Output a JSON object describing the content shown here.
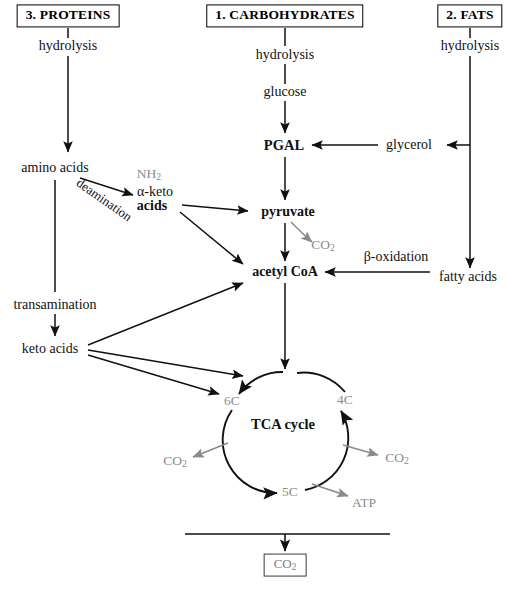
{
  "figure": {
    "caption": "",
    "colors": {
      "stroke_black": "#111111",
      "stroke_grey": "#8a8a8a",
      "text_black": "#111111",
      "text_grey": "#8a8a8a",
      "background": "#ffffff"
    }
  },
  "headers": [
    {
      "id": "proteins",
      "label": "3. PROTEINS",
      "x": 68,
      "y": 16
    },
    {
      "id": "carbohydrates",
      "label": "1. CARBOHYDRATES",
      "x": 285,
      "y": 16
    },
    {
      "id": "fats",
      "label": "2. FATS",
      "x": 470,
      "y": 16
    }
  ],
  "nodes": [
    {
      "id": "hydrolysis-proteins",
      "label": "hydrolysis",
      "x": 68,
      "y": 46,
      "style": "black",
      "size": 14
    },
    {
      "id": "amino-acids",
      "label": "amino acids",
      "x": 55,
      "y": 168,
      "style": "black",
      "size": 14
    },
    {
      "id": "nh2",
      "label": "NH2",
      "x": 149,
      "y": 174,
      "style": "grey",
      "size": 13.5
    },
    {
      "id": "alpha-keto",
      "label": "α-keto",
      "x": 155,
      "y": 192,
      "style": "black",
      "size": 14
    },
    {
      "id": "keto-acids-alpha",
      "label": "acids",
      "x": 152,
      "y": 206,
      "style": "black",
      "size": 14
    },
    {
      "id": "deamination",
      "label": "deamination",
      "x": 104,
      "y": 200,
      "style": "black",
      "size": 13
    },
    {
      "id": "transamination",
      "label": "transamination",
      "x": 55,
      "y": 305,
      "style": "black",
      "size": 14
    },
    {
      "id": "keto-acids",
      "label": "keto acids",
      "x": 50,
      "y": 349,
      "style": "black",
      "size": 14
    },
    {
      "id": "hydrolysis-carbs",
      "label": "hydrolysis",
      "x": 285,
      "y": 55,
      "style": "black",
      "size": 14
    },
    {
      "id": "glucose",
      "label": "glucose",
      "x": 285,
      "y": 92,
      "style": "black",
      "size": 14
    },
    {
      "id": "pgal",
      "label": "PGAL",
      "x": 284,
      "y": 145,
      "style": "black",
      "size": 14.5,
      "bold": true
    },
    {
      "id": "pyruvate",
      "label": "pyruvate",
      "x": 288,
      "y": 212,
      "style": "black",
      "size": 14,
      "bold": true
    },
    {
      "id": "co2-pyruvate",
      "label": "CO2",
      "x": 323,
      "y": 245,
      "style": "grey",
      "size": 13.5
    },
    {
      "id": "acetyl-coa",
      "label": "acetyl CoA",
      "x": 285,
      "y": 272,
      "style": "black",
      "size": 14,
      "bold": true
    },
    {
      "id": "hydrolysis-fats",
      "label": "hydrolysis",
      "x": 470,
      "y": 46,
      "style": "black",
      "size": 14
    },
    {
      "id": "glycerol",
      "label": "glycerol",
      "x": 409,
      "y": 145,
      "style": "black",
      "size": 14
    },
    {
      "id": "beta-oxidation",
      "label": "β-oxidation",
      "x": 396,
      "y": 257,
      "style": "black",
      "size": 14
    },
    {
      "id": "fatty-acids",
      "label": "fatty acids",
      "x": 468,
      "y": 277,
      "style": "black",
      "size": 14
    },
    {
      "id": "tca-cycle",
      "label": "TCA cycle",
      "x": 283,
      "y": 424,
      "style": "black",
      "size": 14.5,
      "bold": true
    },
    {
      "id": "carbon-6c",
      "label": "6C",
      "x": 232,
      "y": 401,
      "style": "grey",
      "size": 13.5
    },
    {
      "id": "carbon-4c",
      "label": "4C",
      "x": 345,
      "y": 400,
      "style": "grey",
      "size": 13.5
    },
    {
      "id": "carbon-5c",
      "label": "5C",
      "x": 290,
      "y": 492,
      "style": "grey",
      "size": 13.5
    },
    {
      "id": "co2-left",
      "label": "CO2",
      "x": 175,
      "y": 461,
      "style": "grey",
      "size": 13.5
    },
    {
      "id": "co2-right",
      "label": "CO2",
      "x": 397,
      "y": 458,
      "style": "grey",
      "size": 13.5
    },
    {
      "id": "atp",
      "label": "ATP",
      "x": 364,
      "y": 503,
      "style": "grey",
      "size": 13.5
    }
  ],
  "outputs": [
    {
      "id": "co2-output",
      "label": "CO2",
      "x": 285,
      "y": 565
    }
  ]
}
